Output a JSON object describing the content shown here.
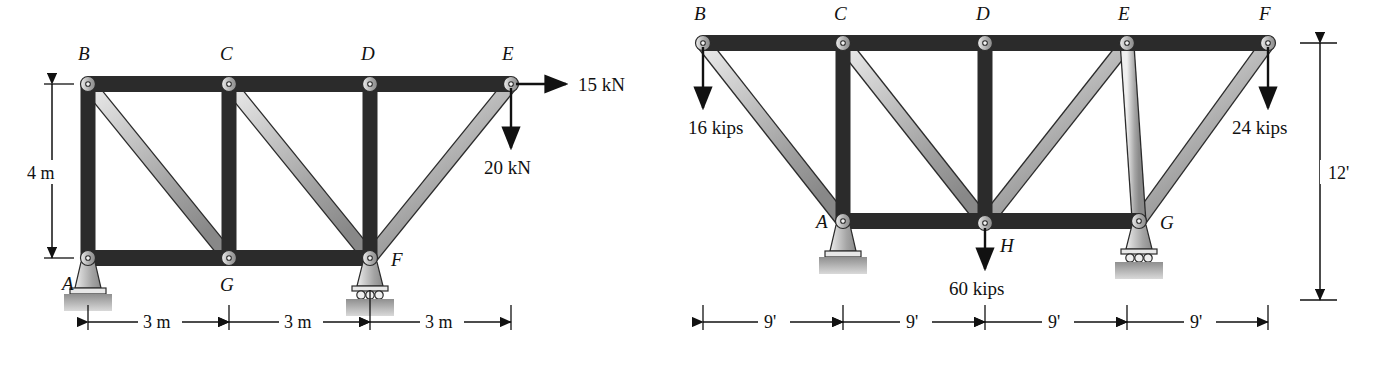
{
  "figure": {
    "type": "engineering-statics-truss-figure",
    "background": "#ffffff",
    "member_fill_light": "#d8d8d8",
    "member_fill_mid": "#a9a9a9",
    "member_fill_dark": "#8a8a8a",
    "outline": "#2b2b2b",
    "ground_fill": "#9c9c9c"
  },
  "left_truss": {
    "name": "left-truss",
    "units": "metric",
    "nodes": [
      {
        "id": "A",
        "label": "A",
        "x": 88,
        "y": 258,
        "label_x": 62,
        "label_y": 290
      },
      {
        "id": "B",
        "label": "B",
        "x": 88,
        "y": 84,
        "label_x": 78,
        "label_y": 60
      },
      {
        "id": "C",
        "label": "C",
        "x": 229,
        "y": 84,
        "label_x": 220,
        "label_y": 60
      },
      {
        "id": "D",
        "label": "D",
        "x": 370,
        "y": 84,
        "label_x": 361,
        "label_y": 60
      },
      {
        "id": "E",
        "label": "E",
        "x": 511,
        "y": 84,
        "label_x": 502,
        "label_y": 60
      },
      {
        "id": "F",
        "label": "F",
        "x": 370,
        "y": 258,
        "label_x": 391,
        "label_y": 266
      },
      {
        "id": "G",
        "label": "G",
        "x": 229,
        "y": 258,
        "label_x": 220,
        "label_y": 291
      }
    ],
    "members": [
      {
        "from": "B",
        "to": "C"
      },
      {
        "from": "C",
        "to": "D"
      },
      {
        "from": "D",
        "to": "E"
      },
      {
        "from": "A",
        "to": "G"
      },
      {
        "from": "G",
        "to": "F"
      },
      {
        "from": "A",
        "to": "B"
      },
      {
        "from": "C",
        "to": "G"
      },
      {
        "from": "D",
        "to": "F"
      },
      {
        "from": "B",
        "to": "G"
      },
      {
        "from": "C",
        "to": "F"
      },
      {
        "from": "E",
        "to": "F"
      }
    ],
    "supports": [
      {
        "at": "A",
        "kind": "pin"
      },
      {
        "at": "F",
        "kind": "roller"
      }
    ],
    "loads": [
      {
        "id": "load-15kn",
        "at": "E",
        "label": "15 kN",
        "direction": "right",
        "label_x": 578,
        "label_y": 91
      },
      {
        "id": "load-20kn",
        "at": "E",
        "label": "20 kN",
        "direction": "down",
        "label_x": 484,
        "label_y": 174
      }
    ],
    "vertical_dimension": {
      "label": "4 m",
      "label_x": 27,
      "label_y": 176
    },
    "horizontal_dimensions": [
      {
        "label": "3 m",
        "label_x": 158,
        "label_y": 329
      },
      {
        "label": "3 m",
        "label_x": 299,
        "label_y": 329
      },
      {
        "label": "3 m",
        "label_x": 440,
        "label_y": 329
      }
    ]
  },
  "right_truss": {
    "name": "right-truss",
    "units": "imperial",
    "nodes": [
      {
        "id": "A",
        "label": "A",
        "x": 843,
        "y": 221,
        "label_x": 816,
        "label_y": 228
      },
      {
        "id": "B",
        "label": "B",
        "x": 703,
        "y": 43,
        "label_x": 694,
        "label_y": 20
      },
      {
        "id": "C",
        "label": "C",
        "x": 843,
        "y": 43,
        "label_x": 834,
        "label_y": 20
      },
      {
        "id": "D",
        "label": "D",
        "x": 985,
        "y": 43,
        "label_x": 976,
        "label_y": 20
      },
      {
        "id": "E",
        "label": "E",
        "x": 1127,
        "y": 43,
        "label_x": 1118,
        "label_y": 20
      },
      {
        "id": "F",
        "label": "F",
        "x": 1268,
        "y": 43,
        "label_x": 1259,
        "label_y": 20
      },
      {
        "id": "G",
        "label": "G",
        "x": 1139,
        "y": 221,
        "label_x": 1160,
        "label_y": 229
      },
      {
        "id": "H",
        "label": "H",
        "x": 985,
        "y": 223,
        "label_x": 1000,
        "label_y": 252
      }
    ],
    "members": [
      {
        "from": "B",
        "to": "C"
      },
      {
        "from": "C",
        "to": "D"
      },
      {
        "from": "D",
        "to": "E"
      },
      {
        "from": "E",
        "to": "F"
      },
      {
        "from": "A",
        "to": "H"
      },
      {
        "from": "H",
        "to": "G"
      },
      {
        "from": "A",
        "to": "C"
      },
      {
        "from": "D",
        "to": "H"
      },
      {
        "from": "E",
        "to": "G"
      },
      {
        "from": "B",
        "to": "A"
      },
      {
        "from": "C",
        "to": "H"
      },
      {
        "from": "E",
        "to": "H"
      },
      {
        "from": "F",
        "to": "G"
      }
    ],
    "supports": [
      {
        "at": "A",
        "kind": "pin"
      },
      {
        "at": "G",
        "kind": "roller"
      }
    ],
    "loads": [
      {
        "id": "load-16kips",
        "at": "B",
        "label": "16 kips",
        "direction": "down",
        "label_x": 688,
        "label_y": 134
      },
      {
        "id": "load-24kips",
        "at": "F",
        "label": "24 kips",
        "direction": "down",
        "label_x": 1232,
        "label_y": 134
      },
      {
        "id": "load-60kips",
        "at": "H",
        "label": "60 kips",
        "direction": "down",
        "label_x": 949,
        "label_y": 295
      }
    ],
    "vertical_dimension": {
      "label": "12'",
      "label_x": 1330,
      "label_y": 178
    },
    "horizontal_dimensions": [
      {
        "label": "9'",
        "label_x": 764,
        "label_y": 329
      },
      {
        "label": "9'",
        "label_x": 906,
        "label_y": 329
      },
      {
        "label": "9'",
        "label_x": 1048,
        "label_y": 329
      },
      {
        "label": "9'",
        "label_x": 1190,
        "label_y": 329
      }
    ]
  }
}
